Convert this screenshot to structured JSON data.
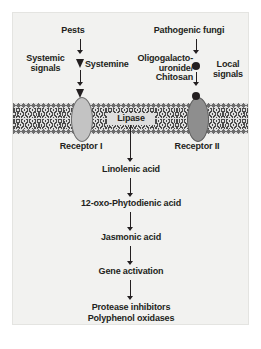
{
  "figure": {
    "background_color": "#f2f2f0",
    "text_color": "#231f20"
  },
  "stimuli": {
    "left": "Pests",
    "right": "Pathogenic fungi"
  },
  "signal_types": {
    "left": "Systemic\nsignals",
    "right": "Local\nsignals"
  },
  "elicitors": {
    "left": "Systemine",
    "right": "Oligogalacto-\nuronide/\nChitosan"
  },
  "membrane": {
    "enzyme": "Lipase",
    "receptor_left": "Receptor I",
    "receptor_right": "Receptor II",
    "receptor_left_color": "#c3c3c3",
    "receptor_right_color": "#8e8e8e"
  },
  "cascade": [
    "Linolenic acid",
    "12-oxo-Phytodienic acid",
    "Jasmonic acid",
    "Gene activation"
  ],
  "outputs": [
    "Protease inhibitors",
    "Polyphenol oxidases"
  ]
}
